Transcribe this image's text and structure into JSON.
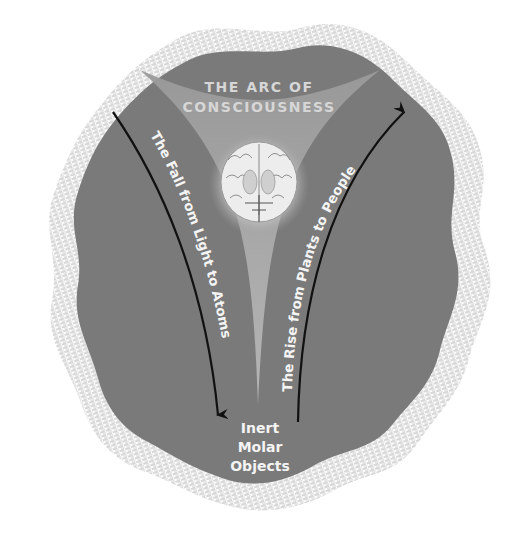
{
  "diagram": {
    "title_line1": "THE ARC OF",
    "title_line2": "CONSCIOUSNESS",
    "left_arrow_label": "The Fall from Light to Atoms",
    "right_arrow_label": "The Rise from Plants to People",
    "bottom_line1": "Inert",
    "bottom_line2": "Molar",
    "bottom_line3": "Objects",
    "center_image": "brain-cross-section",
    "colors": {
      "blob_fill": "#7a7a7a",
      "funnel_fill": "#a8a8a8",
      "halo": "#c8c8c8",
      "hatch": "#b5b5b5",
      "arrow": "#111111",
      "text": "#f4f4f4"
    }
  }
}
